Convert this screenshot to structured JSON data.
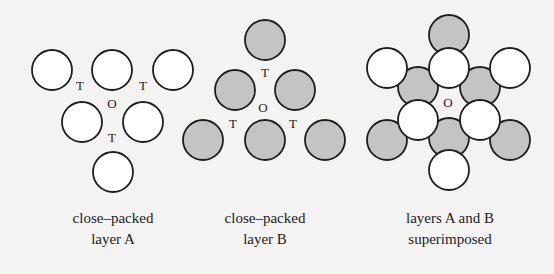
{
  "colors": {
    "background": "#f3f3f2",
    "stroke": "#1e1e1e",
    "layer_a_fill": "#ffffff",
    "layer_b_fill": "#c4c4c4"
  },
  "panels": [
    {
      "caption": [
        "close–packed",
        "layer A"
      ],
      "caption_x": 113,
      "circles": [
        {
          "x": 52,
          "y": 70,
          "layer": "A"
        },
        {
          "x": 112,
          "y": 70,
          "layer": "A"
        },
        {
          "x": 173,
          "y": 70,
          "layer": "A"
        },
        {
          "x": 82,
          "y": 122,
          "layer": "A"
        },
        {
          "x": 143,
          "y": 122,
          "layer": "A"
        },
        {
          "x": 113,
          "y": 172,
          "layer": "A"
        }
      ],
      "labels": [
        {
          "text": "T",
          "x": 80,
          "y": 90
        },
        {
          "text": "T",
          "x": 143,
          "y": 90
        },
        {
          "text": "O",
          "x": 112,
          "y": 108
        },
        {
          "text": "T",
          "x": 112,
          "y": 142
        }
      ]
    },
    {
      "caption": [
        "close–packed",
        "layer B"
      ],
      "caption_x": 265,
      "circles": [
        {
          "x": 265,
          "y": 40,
          "layer": "B"
        },
        {
          "x": 235,
          "y": 90,
          "layer": "B"
        },
        {
          "x": 295,
          "y": 90,
          "layer": "B"
        },
        {
          "x": 203,
          "y": 140,
          "layer": "B"
        },
        {
          "x": 265,
          "y": 140,
          "layer": "B"
        },
        {
          "x": 325,
          "y": 140,
          "layer": "B"
        }
      ],
      "labels": [
        {
          "text": "T",
          "x": 265,
          "y": 77
        },
        {
          "text": "O",
          "x": 263,
          "y": 112
        },
        {
          "text": "T",
          "x": 233,
          "y": 128
        },
        {
          "text": "T",
          "x": 293,
          "y": 128
        }
      ]
    },
    {
      "caption": [
        "layers A and B",
        "superimposed"
      ],
      "caption_x": 450,
      "circles": [
        {
          "x": 449,
          "y": 35,
          "layer": "B"
        },
        {
          "x": 418,
          "y": 87,
          "layer": "B"
        },
        {
          "x": 480,
          "y": 87,
          "layer": "B"
        },
        {
          "x": 387,
          "y": 140,
          "layer": "B"
        },
        {
          "x": 449,
          "y": 138,
          "layer": "B"
        },
        {
          "x": 510,
          "y": 140,
          "layer": "B"
        },
        {
          "x": 387,
          "y": 68,
          "layer": "A"
        },
        {
          "x": 449,
          "y": 68,
          "layer": "A"
        },
        {
          "x": 510,
          "y": 68,
          "layer": "A"
        },
        {
          "x": 418,
          "y": 120,
          "layer": "A"
        },
        {
          "x": 480,
          "y": 120,
          "layer": "A"
        },
        {
          "x": 449,
          "y": 170,
          "layer": "A"
        }
      ],
      "labels": [
        {
          "text": "O",
          "x": 448,
          "y": 107
        }
      ]
    }
  ],
  "radius": 20
}
